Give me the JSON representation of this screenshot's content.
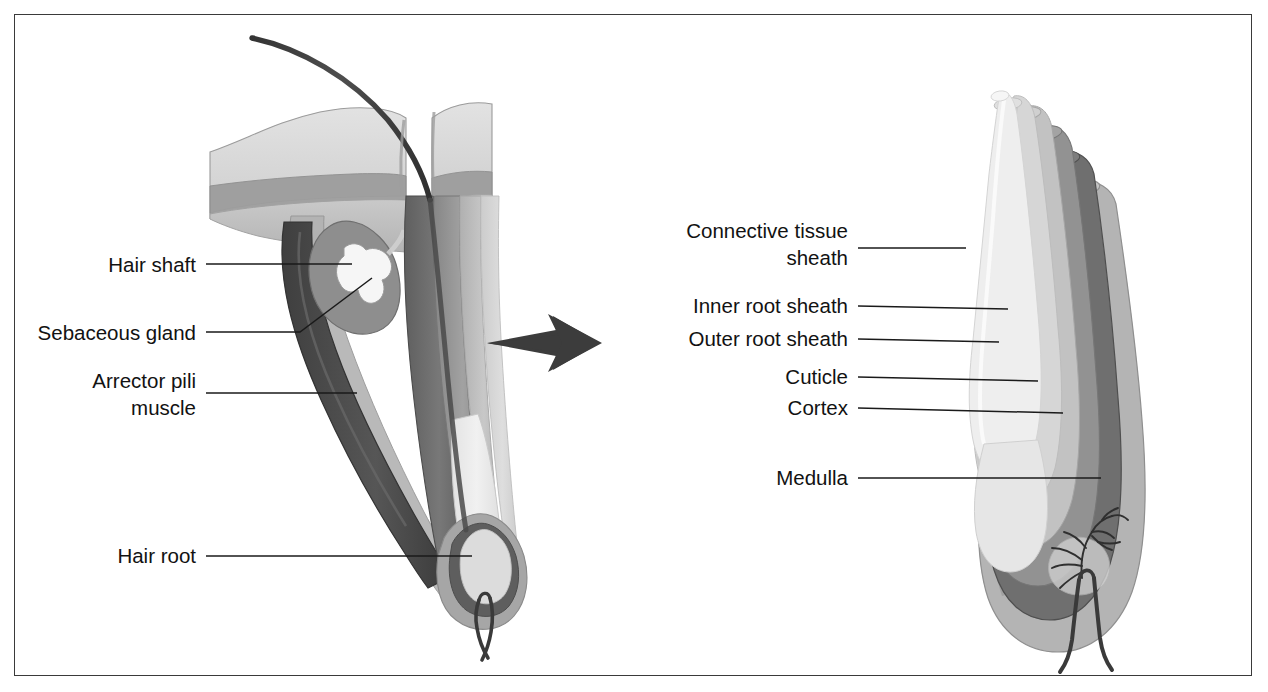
{
  "figure": {
    "border_color": "#3a3a3a",
    "background": "#ffffff"
  },
  "left_panel": {
    "name": "hair-follicle-in-skin",
    "description": "Longitudinal section of hair follicle within skin",
    "labels": [
      {
        "id": "hair-shaft",
        "text": "Hair shaft",
        "text2": "",
        "x": 196,
        "y": 272,
        "line_from_x": 206,
        "line_from_y": 264,
        "line_to_x": 352,
        "line_to_y": 264,
        "elbow": false
      },
      {
        "id": "sebaceous-gland",
        "text": "Sebaceous gland",
        "text2": "",
        "x": 196,
        "y": 340,
        "line_from_x": 206,
        "line_from_y": 332,
        "line_to_x": 300,
        "line_to_y": 332,
        "elbow": true,
        "line_to2_x": 372,
        "line_to2_y": 278
      },
      {
        "id": "arrector-pili",
        "text": "Arrector pili",
        "text2": "muscle",
        "x": 196,
        "y": 388,
        "line_from_x": 206,
        "line_from_y": 393,
        "line_to_x": 357,
        "line_to_y": 393,
        "elbow": false
      },
      {
        "id": "hair-root",
        "text": "Hair root",
        "text2": "",
        "x": 196,
        "y": 563,
        "line_from_x": 206,
        "line_from_y": 556,
        "line_to_x": 472,
        "line_to_y": 556,
        "elbow": false
      }
    ]
  },
  "right_panel": {
    "name": "hair-follicle-cross-section",
    "description": "Cut-away cylindrical view showing concentric layers of hair follicle",
    "labels": [
      {
        "id": "connective-tissue-sheath",
        "text": "Connective tissue",
        "text2": "sheath",
        "x": 848,
        "y": 238,
        "line_from_x": 858,
        "line_from_y": 248,
        "line_to_x": 966,
        "line_to_y": 248,
        "elbow": false
      },
      {
        "id": "inner-root-sheath",
        "text": "Inner root sheath",
        "text2": "",
        "x": 848,
        "y": 313,
        "line_from_x": 858,
        "line_from_y": 306,
        "line_to_x": 1008,
        "line_to_y": 309,
        "elbow": false
      },
      {
        "id": "outer-root-sheath",
        "text": "Outer root sheath",
        "text2": "",
        "x": 848,
        "y": 345,
        "line_from_x": 858,
        "line_from_y": 339,
        "line_to_x": 999,
        "line_to_y": 342,
        "elbow": false
      },
      {
        "id": "cuticle",
        "text": "Cuticle",
        "text2": "",
        "x": 848,
        "y": 383,
        "line_from_x": 858,
        "line_from_y": 377,
        "line_to_x": 1038,
        "line_to_y": 381,
        "elbow": false
      },
      {
        "id": "cortex",
        "text": "Cortex",
        "text2": "",
        "x": 848,
        "y": 414,
        "line_from_x": 858,
        "line_from_y": 408,
        "line_to_x": 1063,
        "line_to_y": 413,
        "elbow": false
      },
      {
        "id": "medulla",
        "text": "Medulla",
        "text2": "",
        "x": 848,
        "y": 485,
        "line_from_x": 858,
        "line_from_y": 478,
        "line_to_x": 1101,
        "line_to_y": 478,
        "elbow": false
      }
    ]
  },
  "arrow": {
    "name": "transition-arrow",
    "color": "#3c3c3c",
    "tail_x": 487,
    "tip_x": 600,
    "y": 343
  },
  "palette": {
    "epidermis_light": "#d8d8d8",
    "epidermis_mid": "#c6c6c6",
    "dermis_band": "#9a9a9a",
    "dermis_deep": "#bdbdbd",
    "connective_sheath": "#a8a8a8",
    "outer_root_sheath": "#6e6e6e",
    "inner_root_sheath": "#8e8e8e",
    "cuticle": "#bcbcbc",
    "cortex": "#d2d2d2",
    "medulla": "#ececec",
    "hair_shaft_dark": "#3d3d3d",
    "muscle_dark": "#4a4a4a",
    "sebaceous_pale": "#f4f4f4",
    "outline": "#5a5a5a",
    "label_ink": "#121212"
  }
}
